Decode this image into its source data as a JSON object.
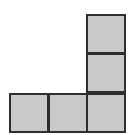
{
  "figure": {
    "cell_size": 40,
    "fill_color": "#c9c9c9",
    "border_color": "#2e2e2e",
    "cells": [
      {
        "col": 2,
        "row": 0,
        "x": 86,
        "y": 14
      },
      {
        "col": 2,
        "row": 1,
        "x": 86,
        "y": 53
      },
      {
        "col": 0,
        "row": 2,
        "x": 9,
        "y": 93
      },
      {
        "col": 1,
        "row": 2,
        "x": 48,
        "y": 93
      },
      {
        "col": 2,
        "row": 2,
        "x": 86,
        "y": 93
      }
    ]
  }
}
